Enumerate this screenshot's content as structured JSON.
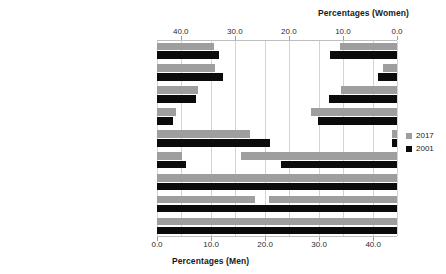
{
  "chart_data": {
    "type": "bar",
    "orientation": "horizontal",
    "layout": "back-to-back population pyramid",
    "title": "",
    "categories": [
      "Elementary occupations",
      "Process, plant & machine operatives",
      "Sales & customer services",
      "Caring, leisure & other services",
      "Skilled trades",
      "Administrative & secretarial",
      "Associate professional & technical",
      "Professional occupations",
      "Managers, directors & senior officials"
    ],
    "panels": [
      {
        "name": "Men",
        "axis_title": "Percentages (Men)",
        "axis_position": "bottom",
        "direction": "left-to-right",
        "ticks": [
          "0.0",
          "10.0",
          "20.0",
          "30.0",
          "40.0"
        ],
        "tick_values": [
          0,
          10,
          20,
          30,
          40
        ],
        "xlim": [
          0,
          44.4
        ],
        "series": [
          {
            "name": "2017",
            "color": "#9e9e9e",
            "values": [
              10.6,
              10.7,
              7.6,
              3.5,
              17.2,
              4.6,
              14.9,
              18.2,
              12.5
            ]
          },
          {
            "name": "2001",
            "color": "#0b0b0b",
            "values": [
              11.5,
              12.2,
              7.2,
              2.9,
              20.9,
              5.4,
              14.5,
              15.0,
              11.6
            ]
          }
        ]
      },
      {
        "name": "Women",
        "axis_title": "Percentages (Women)",
        "axis_position": "top",
        "direction": "right-to-left",
        "ticks": [
          "40.0",
          "30.0",
          "20.0",
          "10.0",
          "0.0"
        ],
        "tick_values": [
          40,
          30,
          20,
          10,
          0
        ],
        "xlim": [
          0,
          44.4
        ],
        "series": [
          {
            "name": "2017",
            "color": "#9e9e9e",
            "values": [
              10.6,
              2.5,
              10.4,
              16.0,
              0.9,
              28.9,
              32.0,
              23.6,
              37.0
            ]
          },
          {
            "name": "2001",
            "color": "#0b0b0b",
            "values": [
              12.4,
              3.5,
              12.6,
              14.6,
              0.9,
              21.4,
              34.6,
              29.6,
              38.7
            ]
          }
        ]
      }
    ],
    "legend": {
      "position": "right",
      "entries": [
        {
          "label": "2017",
          "color": "#9e9e9e"
        },
        {
          "label": "2001",
          "color": "#0b0b0b"
        }
      ]
    },
    "grid": {
      "vertical": true,
      "horizontal": false,
      "color": "#d4d4d4"
    }
  }
}
